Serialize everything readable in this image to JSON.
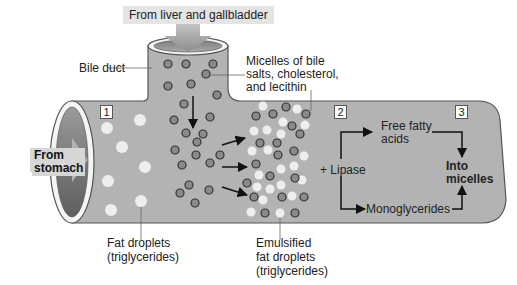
{
  "diagram": {
    "title_banner": "From liver and gallbladder",
    "labels": {
      "bile_duct": "Bile duct",
      "micelles_line1": "Micelles of bile",
      "micelles_line2": "salts, cholesterol,",
      "micelles_line3": "and lecithin",
      "from_stomach_line1": "From",
      "from_stomach_line2": "stomach",
      "fat_droplets_line1": "Fat droplets",
      "fat_droplets_line2": "(triglycerides)",
      "emulsified_line1": "Emulsified",
      "emulsified_line2": "fat droplets",
      "emulsified_line3": "(triglycerides)",
      "lipase": "+ Lipase",
      "free_fatty_line1": "Free fatty",
      "free_fatty_line2": "acids",
      "monoglycerides": "Monoglycerides",
      "into_micelles_line1": "Into",
      "into_micelles_line2": "micelles"
    },
    "step_numbers": [
      "1",
      "2",
      "3"
    ],
    "colors": {
      "tube_fill": "#b3b3b3",
      "tube_outline": "#555555",
      "bile_particle": "#8a8a8a",
      "fat_droplet": "#eeeeee",
      "arrow": "#111111",
      "banner_bg": "#e4e4e4"
    }
  }
}
